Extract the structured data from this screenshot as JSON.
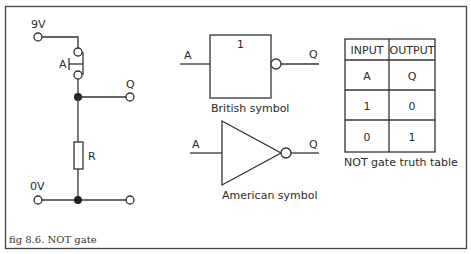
{
  "caption": "fig 8.6. NOT gate",
  "circuit": {
    "supply_label": "9V",
    "ground_label": "0V",
    "switch_label": "A",
    "output_label": "Q",
    "resistor_label": "R"
  },
  "british_symbol": {
    "gate_text": "1",
    "input_label": "A",
    "output_label": "Q",
    "caption": "British symbol"
  },
  "american_symbol": {
    "input_label": "A",
    "output_label": "Q",
    "caption": "American symbol"
  },
  "truth_table": {
    "headers": [
      "INPUT",
      "OUTPUT"
    ],
    "rows": [
      [
        "A",
        "Q"
      ],
      [
        "1",
        "0"
      ],
      [
        "0",
        "1"
      ]
    ],
    "caption": "NOT gate truth table"
  }
}
